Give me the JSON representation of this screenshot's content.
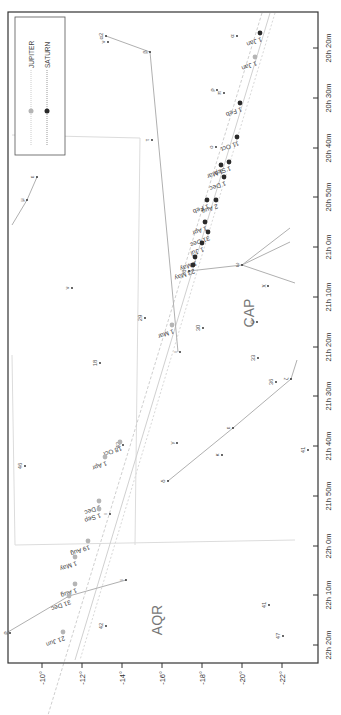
{
  "colors": {
    "jupiter": "#b5b5b5",
    "saturn": "#2a2a2a",
    "constellation_line": "#b0b0b0",
    "boundary": "#dcdcdc",
    "frame": "#333333",
    "text": "#444444"
  },
  "legend": {
    "items": [
      {
        "label": "JUPITER",
        "color": "#b5b5b5"
      },
      {
        "label": "SATURN",
        "color": "#2a2a2a"
      }
    ]
  },
  "chart_data": {
    "type": "scatter",
    "title": "",
    "orientation": "rotated 90° (declination on horizontal axis, right ascension on vertical axis)",
    "xlabel": "Declination",
    "ylabel": "Right Ascension",
    "dec_ticks": [
      "-10°",
      "-12°",
      "-14°",
      "-16°",
      "-18°",
      "-20°",
      "-22°"
    ],
    "ra_ticks": [
      "20h 20m",
      "20h 30m",
      "20h 40m",
      "20h 50m",
      "21h 0m",
      "21h 10m",
      "21h 20m",
      "21h 30m",
      "21h 40m",
      "21h 50m",
      "22h 0m",
      "22h 10m",
      "22h 20m"
    ],
    "constellations": [
      {
        "abbr": "CAP",
        "label_x": 249,
        "label_y": 313
      },
      {
        "abbr": "AQR",
        "label_x": 157,
        "label_y": 620
      }
    ],
    "series": [
      {
        "name": "JUPITER",
        "points": [
          {
            "label": "1 Jan",
            "x": 255,
            "y": 57
          },
          {
            "label": "1 Mar",
            "x": 172,
            "y": 325
          },
          {
            "label": "18 Oct",
            "x": 120,
            "y": 442
          },
          {
            "label": "1 Apr",
            "x": 105,
            "y": 457
          },
          {
            "label": "1 Dec",
            "x": 99,
            "y": 501
          },
          {
            "label": "1 Sep",
            "x": 99,
            "y": 509
          },
          {
            "label": "19 Aug",
            "x": 88,
            "y": 541
          },
          {
            "label": "1 May",
            "x": 75,
            "y": 557
          },
          {
            "label": "1 Aug",
            "x": 75,
            "y": 584
          },
          {
            "label": "31 Dec",
            "x": 69,
            "y": 596
          },
          {
            "label": "21 Jun",
            "x": 63,
            "y": 632
          }
        ]
      },
      {
        "name": "SATURN",
        "points": [
          {
            "label": "1 Jan",
            "x": 260,
            "y": 33
          },
          {
            "label": "1 Feb",
            "x": 240,
            "y": 103
          },
          {
            "label": "11 Oct",
            "x": 237,
            "y": 137
          },
          {
            "label": "1 Sep",
            "x": 229,
            "y": 162
          },
          {
            "label": "1 Mar",
            "x": 221,
            "y": 165
          },
          {
            "label": "1 Dec",
            "x": 224,
            "y": 177
          },
          {
            "label": "2 Aug",
            "x": 216,
            "y": 200
          },
          {
            "label": "1 Feb",
            "x": 207,
            "y": 200
          },
          {
            "label": "1 Apr",
            "x": 205,
            "y": 222
          },
          {
            "label": "31 Dec",
            "x": 208,
            "y": 232
          },
          {
            "label": "1 Jul",
            "x": 202,
            "y": 243
          },
          {
            "label": "1 May",
            "x": 195,
            "y": 257
          },
          {
            "label": "23 May",
            "x": 193,
            "y": 265
          }
        ]
      }
    ],
    "stars": [
      {
        "label": "α",
        "x": 237,
        "y": 36
      },
      {
        "label": "ρ",
        "x": 217,
        "y": 90
      },
      {
        "label": "π",
        "x": 224,
        "y": 93
      },
      {
        "label": "ο",
        "x": 216,
        "y": 147
      },
      {
        "label": "α2",
        "x": 106,
        "y": 36
      },
      {
        "label": "ν",
        "x": 108,
        "y": 42
      },
      {
        "label": "β",
        "x": 150,
        "y": 52
      },
      {
        "label": "τ",
        "x": 152,
        "y": 140
      },
      {
        "label": "ε",
        "x": 37,
        "y": 177
      },
      {
        "label": "μ",
        "x": 27,
        "y": 200
      },
      {
        "label": "ν",
        "x": 72,
        "y": 288
      },
      {
        "label": "29",
        "x": 145,
        "y": 318
      },
      {
        "label": "30",
        "x": 203,
        "y": 328
      },
      {
        "label": "18",
        "x": 100,
        "y": 363
      },
      {
        "label": "ι",
        "x": 180,
        "y": 352
      },
      {
        "label": "ψ",
        "x": 257,
        "y": 322
      },
      {
        "label": "ω",
        "x": 242,
        "y": 265
      },
      {
        "label": "χ",
        "x": 268,
        "y": 286
      },
      {
        "label": "θ",
        "x": 189,
        "y": 271
      },
      {
        "label": "33",
        "x": 258,
        "y": 358
      },
      {
        "label": "36",
        "x": 276,
        "y": 382
      },
      {
        "label": "ζ",
        "x": 291,
        "y": 379
      },
      {
        "label": "ε",
        "x": 233,
        "y": 428
      },
      {
        "label": "γ",
        "x": 177,
        "y": 443
      },
      {
        "label": "κ",
        "x": 222,
        "y": 455
      },
      {
        "label": "δ",
        "x": 168,
        "y": 481
      },
      {
        "label": "41",
        "x": 308,
        "y": 450
      },
      {
        "label": "42",
        "x": 123,
        "y": 445
      },
      {
        "label": "46",
        "x": 25,
        "y": 466
      },
      {
        "label": "ι",
        "x": 110,
        "y": 514
      },
      {
        "label": "ι",
        "x": 126,
        "y": 580
      },
      {
        "label": "ρ",
        "x": 10,
        "y": 633
      },
      {
        "label": "42",
        "x": 106,
        "y": 626
      },
      {
        "label": "41",
        "x": 269,
        "y": 605
      },
      {
        "label": "47",
        "x": 283,
        "y": 636
      }
    ]
  }
}
